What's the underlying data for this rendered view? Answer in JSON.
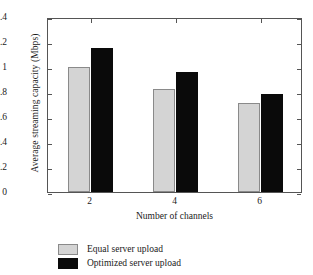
{
  "chart_data": {
    "type": "bar",
    "title": "",
    "xlabel": "Number of channels",
    "ylabel": "Average streaming capacity (Mbps)",
    "categories": [
      "2",
      "4",
      "6"
    ],
    "series": [
      {
        "name": "Equal server upload",
        "color": "#d4d4d4",
        "values": [
          1.0,
          0.825,
          0.71
        ]
      },
      {
        "name": "Optimized server upload",
        "color": "#0a0a0a",
        "values": [
          1.15,
          0.96,
          0.785
        ]
      }
    ],
    "ylim": [
      0,
      1.4
    ],
    "ytick_labels": [
      "0",
      "0.2",
      "0.4",
      "0.6",
      "0.8",
      "1",
      "1.2",
      "1.4"
    ],
    "ytick_values": [
      0,
      0.2,
      0.4,
      0.6,
      0.8,
      1.0,
      1.2,
      1.4
    ],
    "xtick_labels": [
      "2",
      "4",
      "6"
    ],
    "grid": false,
    "legend_position": "bottom-left",
    "frame": true
  },
  "legend": {
    "entries": [
      {
        "label": "Equal server upload",
        "swatch": "gray"
      },
      {
        "label": "Optimized server upload",
        "swatch": "black"
      }
    ]
  }
}
